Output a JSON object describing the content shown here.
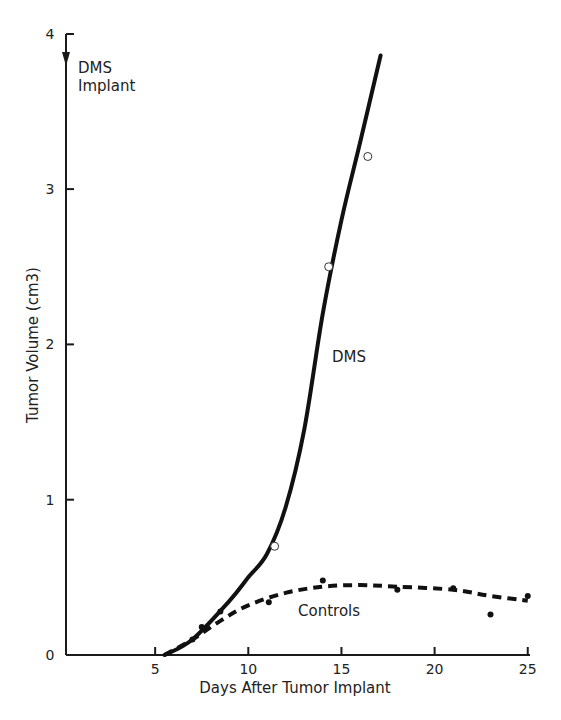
{
  "chart_data": {
    "type": "line",
    "title": "",
    "xlabel": "Days After Tumor Implant",
    "ylabel": "Tumor Volume (cm3)",
    "xlim": [
      0,
      25
    ],
    "ylim": [
      0,
      4
    ],
    "xticks": [
      5,
      10,
      15,
      20,
      25
    ],
    "yticks": [
      0,
      1,
      2,
      3,
      4
    ],
    "grid": false,
    "legend": null,
    "annotations": [
      {
        "text": "DMS Implant",
        "x": 0,
        "y": 3.8,
        "arrow": "down",
        "lines": [
          "DMS",
          "Implant"
        ]
      },
      {
        "text": "DMS",
        "x": 14.5,
        "y": 1.9
      },
      {
        "text": "Controls",
        "x": 12.8,
        "y": 0.28
      }
    ],
    "series": [
      {
        "name": "DMS",
        "style": "solid",
        "marker": "open-circle",
        "points": [
          {
            "x": 11.2,
            "y": 0.7
          },
          {
            "x": 14.1,
            "y": 2.5
          },
          {
            "x": 16.2,
            "y": 3.21
          }
        ],
        "curve": [
          {
            "x": 5.5,
            "y": 0.0
          },
          {
            "x": 7.0,
            "y": 0.1
          },
          {
            "x": 9.0,
            "y": 0.35
          },
          {
            "x": 10.0,
            "y": 0.5
          },
          {
            "x": 11.0,
            "y": 0.65
          },
          {
            "x": 12.0,
            "y": 0.95
          },
          {
            "x": 13.0,
            "y": 1.45
          },
          {
            "x": 14.0,
            "y": 2.2
          },
          {
            "x": 15.0,
            "y": 2.8
          },
          {
            "x": 16.0,
            "y": 3.3
          },
          {
            "x": 17.1,
            "y": 3.86
          }
        ]
      },
      {
        "name": "Controls",
        "style": "dashed",
        "marker": "filled-circle",
        "points": [
          {
            "x": 7.0,
            "y": 0.1
          },
          {
            "x": 7.5,
            "y": 0.18
          },
          {
            "x": 8.5,
            "y": 0.28
          },
          {
            "x": 11.1,
            "y": 0.34
          },
          {
            "x": 14.0,
            "y": 0.48
          },
          {
            "x": 18.0,
            "y": 0.42
          },
          {
            "x": 21.0,
            "y": 0.43
          },
          {
            "x": 23.0,
            "y": 0.26
          },
          {
            "x": 25.0,
            "y": 0.38
          }
        ],
        "curve": [
          {
            "x": 5.5,
            "y": 0.0
          },
          {
            "x": 7.0,
            "y": 0.1
          },
          {
            "x": 8.5,
            "y": 0.22
          },
          {
            "x": 10.0,
            "y": 0.32
          },
          {
            "x": 12.0,
            "y": 0.4
          },
          {
            "x": 14.0,
            "y": 0.44
          },
          {
            "x": 16.0,
            "y": 0.45
          },
          {
            "x": 18.0,
            "y": 0.44
          },
          {
            "x": 21.0,
            "y": 0.42
          },
          {
            "x": 23.0,
            "y": 0.38
          },
          {
            "x": 25.0,
            "y": 0.35
          }
        ]
      }
    ]
  },
  "layout": {
    "x0_px": 62,
    "px_per_day": 18.63,
    "y0_px": 655,
    "px_per_unit": 155.3
  },
  "labels": {
    "xlabel": "Days After Tumor Implant",
    "ylabel": "Tumor Volume (cm3)",
    "implant_line1": "DMS",
    "implant_line2": "Implant",
    "dms": "DMS",
    "controls": "Controls"
  }
}
